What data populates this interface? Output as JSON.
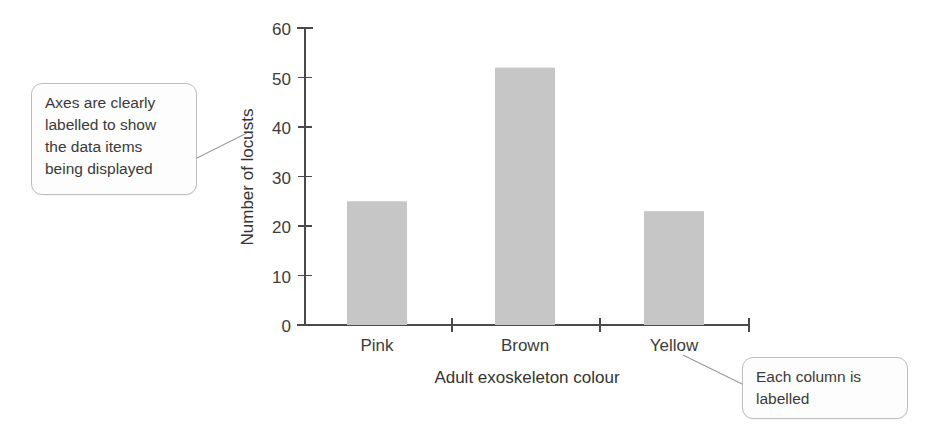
{
  "chart_data": {
    "type": "bar",
    "title": "",
    "subtitle": "",
    "categories": [
      "Pink",
      "Brown",
      "Yellow"
    ],
    "values": [
      25,
      52,
      23
    ],
    "series": [
      {
        "name": "Number of locusts",
        "values": [
          25,
          52,
          23
        ]
      }
    ],
    "xlabel": "Adult exoskeleton colour",
    "ylabel": "Number of locusts",
    "ylim": [
      0,
      60
    ],
    "ytick_labels": [
      "0",
      "10",
      "20",
      "30",
      "40",
      "50",
      "60"
    ],
    "ytick_values": [
      0,
      10,
      20,
      30,
      40,
      50,
      60
    ],
    "ytick_step": 10,
    "grid": false,
    "legend": "none",
    "bar_color": "#c6c6c6",
    "axis_color": "#4a4a4a",
    "text_color": "#3c3c3c"
  },
  "annotations": [
    {
      "id": "axes-note",
      "text": "Axes are clearly labelled to show the data items being displayed",
      "lines": [
        "Axes are clearly",
        "labelled to show",
        "the data items",
        "being displayed"
      ],
      "points_to": "y-axis-title"
    },
    {
      "id": "column-note",
      "text": "Each column is labelled",
      "lines": [
        "Each column is",
        "labelled"
      ],
      "points_to": "category-label-yellow"
    }
  ]
}
